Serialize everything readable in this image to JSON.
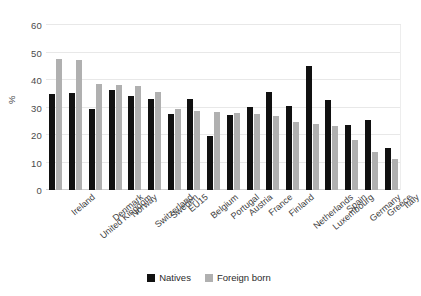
{
  "chart_data": {
    "type": "bar",
    "title": "",
    "xlabel": "",
    "ylabel": "%",
    "ylim": [
      0,
      60
    ],
    "yticks": [
      0,
      10,
      20,
      30,
      40,
      50,
      60
    ],
    "grid": true,
    "legend_position": "bottom-center",
    "categories": [
      "Ireland",
      "United Kingdom",
      "Denmark",
      "Norway",
      "Switzerland",
      "Sweden",
      "EU15",
      "Belgium",
      "Portugal",
      "Austria",
      "France",
      "Finland",
      "Netherlands",
      "Luxembourg",
      "Spain",
      "Germany",
      "Greece",
      "Italy"
    ],
    "series": [
      {
        "name": "Natives",
        "color": "#111111",
        "values": [
          34.8,
          35.4,
          29.3,
          36.3,
          34.3,
          33.2,
          27.5,
          33.0,
          19.5,
          27.4,
          30.1,
          35.5,
          30.6,
          45.1,
          32.9,
          23.6,
          25.4,
          15.1
        ]
      },
      {
        "name": "Foreign born",
        "color": "#b0b0b0",
        "values": [
          47.6,
          47.1,
          38.5,
          38.1,
          37.9,
          35.7,
          29.4,
          28.7,
          28.3,
          28.0,
          27.8,
          26.9,
          24.8,
          24.0,
          23.2,
          18.2,
          14.0,
          11.2
        ]
      }
    ]
  },
  "legend": {
    "items": [
      {
        "label": "Natives"
      },
      {
        "label": "Foreign born"
      }
    ]
  }
}
